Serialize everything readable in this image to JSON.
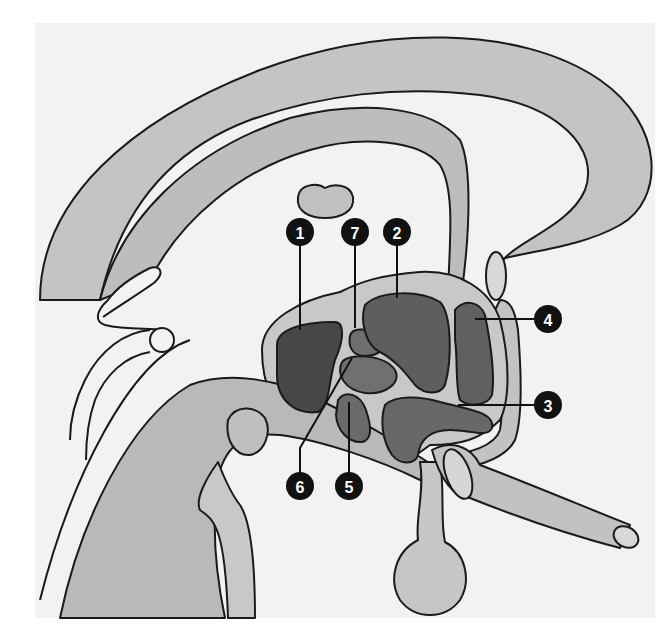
{
  "diagram": {
    "type": "anatomical-sagittal-section",
    "colors": {
      "page_background": "#ffffff",
      "panel_background": "#f2f2f2",
      "outline": "#1a1a1a",
      "tissue_light": "#c9c9c9",
      "tissue_mid": "#b3b3b3",
      "nucleus_dark": "#4a4a4a",
      "nucleus_mid": "#6e6e6e",
      "nucleus_light": "#808080",
      "marker_fill": "#111111",
      "marker_text": "#ffffff"
    },
    "markers": [
      {
        "id": "1",
        "label": "1",
        "cx": 300,
        "cy": 232,
        "target": [
          300,
          330
        ]
      },
      {
        "id": "7",
        "label": "7",
        "cx": 355,
        "cy": 232,
        "target": [
          355,
          328
        ]
      },
      {
        "id": "2",
        "label": "2",
        "cx": 397,
        "cy": 232,
        "target": [
          397,
          298
        ]
      },
      {
        "id": "4",
        "label": "4",
        "cx": 548,
        "cy": 319,
        "target": [
          475,
          319
        ]
      },
      {
        "id": "3",
        "label": "3",
        "cx": 548,
        "cy": 405,
        "target": [
          458,
          405
        ]
      },
      {
        "id": "5",
        "label": "5",
        "cx": 349,
        "cy": 486,
        "target": [
          349,
          402
        ]
      },
      {
        "id": "6",
        "label": "6",
        "cx": 300,
        "cy": 486,
        "target": [
          352,
          358
        ]
      }
    ]
  }
}
